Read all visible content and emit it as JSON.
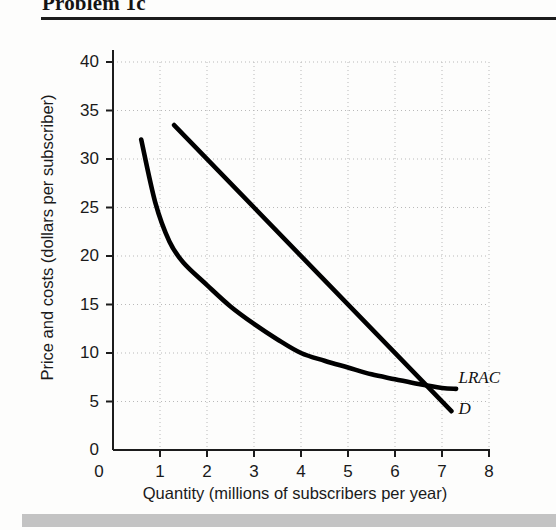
{
  "header": {
    "title": "Problem 1c"
  },
  "chart_data": {
    "type": "line",
    "title": "Problem 1c",
    "xlabel": "Quantity (millions of subscribers per year)",
    "ylabel": "Price and costs (dollars per subscriber)",
    "xlim": [
      0,
      8
    ],
    "ylim": [
      0,
      40
    ],
    "xticks": [
      "0",
      "1",
      "2",
      "3",
      "4",
      "5",
      "6",
      "7",
      "8"
    ],
    "yticks": [
      "0",
      "5",
      "10",
      "15",
      "20",
      "25",
      "30",
      "35",
      "40"
    ],
    "grid": true,
    "grid_style": "dotted",
    "legend": "inline-labels",
    "series": [
      {
        "name": "LRAC",
        "label": "LRAC",
        "shape": "convex-decreasing-curve",
        "color": "#000000",
        "points": [
          [
            0.6,
            32.0
          ],
          [
            0.9,
            25.5
          ],
          [
            1.2,
            21.5
          ],
          [
            1.5,
            19.3
          ],
          [
            2.0,
            17.0
          ],
          [
            2.5,
            14.8
          ],
          [
            3.0,
            13.0
          ],
          [
            3.5,
            11.4
          ],
          [
            4.0,
            10.0
          ],
          [
            4.5,
            9.2
          ],
          [
            5.0,
            8.5
          ],
          [
            5.5,
            7.8
          ],
          [
            6.0,
            7.3
          ],
          [
            6.5,
            6.8
          ],
          [
            7.0,
            6.4
          ],
          [
            7.3,
            6.3
          ]
        ]
      },
      {
        "name": "D",
        "label": "D",
        "shape": "straight-decreasing-line",
        "color": "#000000",
        "points": [
          [
            1.3,
            33.5
          ],
          [
            7.2,
            4.0
          ]
        ]
      }
    ],
    "annotations": [
      {
        "text": "LRAC",
        "x": 7.35,
        "y": 7.4
      },
      {
        "text": "D",
        "x": 7.35,
        "y": 4.2
      }
    ],
    "intersection": {
      "x": 6.9,
      "y": 6.3
    }
  }
}
